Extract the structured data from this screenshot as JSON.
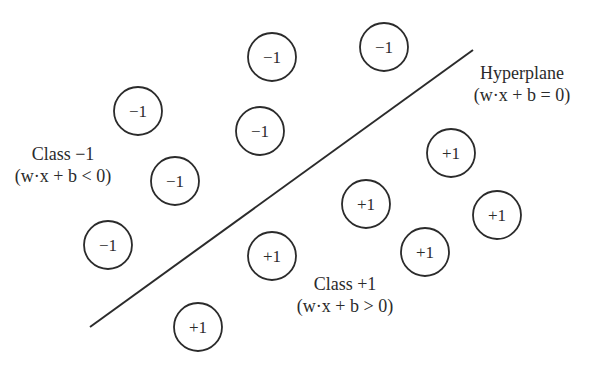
{
  "diagram": {
    "hyperplane": {
      "label": "Hyperplane",
      "equation": "(w·x + b = 0)",
      "line": {
        "x1": 90,
        "y1": 327,
        "x2": 473,
        "y2": 50
      },
      "color": "#2b2b2b"
    },
    "classes": [
      {
        "label": "Class −1",
        "condition": "(w·x + b < 0)"
      },
      {
        "label": "Class +1",
        "condition": "(w·x + b > 0)"
      }
    ],
    "points": [
      {
        "label": "−1",
        "cx": 272,
        "cy": 57
      },
      {
        "label": "−1",
        "cx": 384,
        "cy": 47
      },
      {
        "label": "−1",
        "cx": 138,
        "cy": 111
      },
      {
        "label": "−1",
        "cx": 260,
        "cy": 131
      },
      {
        "label": "−1",
        "cx": 175,
        "cy": 181
      },
      {
        "label": "−1",
        "cx": 108,
        "cy": 245
      },
      {
        "label": "+1",
        "cx": 451,
        "cy": 153
      },
      {
        "label": "+1",
        "cx": 366,
        "cy": 204
      },
      {
        "label": "+1",
        "cx": 497,
        "cy": 215
      },
      {
        "label": "+1",
        "cx": 425,
        "cy": 252
      },
      {
        "label": "+1",
        "cx": 272,
        "cy": 256
      },
      {
        "label": "+1",
        "cx": 198,
        "cy": 327
      }
    ],
    "point_radius": 24
  }
}
